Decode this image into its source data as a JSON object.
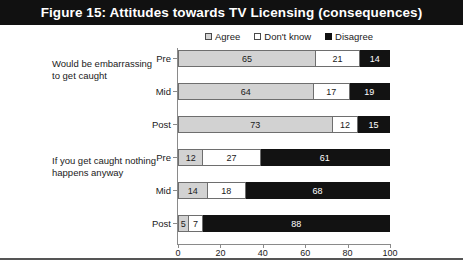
{
  "title": "Figure 15: Attitudes towards TV Licensing (consequences)",
  "legend": [
    {
      "label": "Agree",
      "key": "agree",
      "color": "#d2d2d2"
    },
    {
      "label": "Don't know",
      "key": "dk",
      "color": "#ffffff"
    },
    {
      "label": "Disagree",
      "key": "dis",
      "color": "#121212"
    }
  ],
  "axis": {
    "ticks": [
      "0",
      "20",
      "40",
      "60",
      "80",
      "100"
    ],
    "min": 0,
    "max": 100
  },
  "groups": [
    {
      "caption": "Would be embarrassing to get caught",
      "rows": [
        {
          "label": "Pre",
          "agree": 65,
          "dk": 21,
          "dis": 14
        },
        {
          "label": "Mid",
          "agree": 64,
          "dk": 17,
          "dis": 19
        },
        {
          "label": "Post",
          "agree": 73,
          "dk": 12,
          "dis": 15
        }
      ]
    },
    {
      "caption": "If you get caught nothing happens anyway",
      "rows": [
        {
          "label": "Pre",
          "agree": 12,
          "dk": 27,
          "dis": 61
        },
        {
          "label": "Mid",
          "agree": 14,
          "dk": 18,
          "dis": 68
        },
        {
          "label": "Post",
          "agree": 5,
          "dk": 7,
          "dis": 88
        }
      ]
    }
  ],
  "chart_data": {
    "type": "bar",
    "orientation": "horizontal",
    "stacked": true,
    "title": "Figure 15: Attitudes towards TV Licensing (consequences)",
    "xlabel": "",
    "ylabel": "",
    "xlim": [
      0,
      100
    ],
    "xticks": [
      0,
      20,
      40,
      60,
      80,
      100
    ],
    "grid": false,
    "legend_position": "top",
    "group_labels": [
      "Would be embarrassing to get caught",
      "If you get caught nothing happens anyway"
    ],
    "categories": [
      "Would be embarrassing to get caught - Pre",
      "Would be embarrassing to get caught - Mid",
      "Would be embarrassing to get caught - Post",
      "If you get caught nothing happens anyway - Pre",
      "If you get caught nothing happens anyway - Mid",
      "If you get caught nothing happens anyway - Post"
    ],
    "series": [
      {
        "name": "Agree",
        "values": [
          65,
          64,
          73,
          12,
          14,
          5
        ]
      },
      {
        "name": "Don't know",
        "values": [
          21,
          17,
          12,
          27,
          18,
          7
        ]
      },
      {
        "name": "Disagree",
        "values": [
          14,
          19,
          15,
          61,
          68,
          88
        ]
      }
    ]
  }
}
